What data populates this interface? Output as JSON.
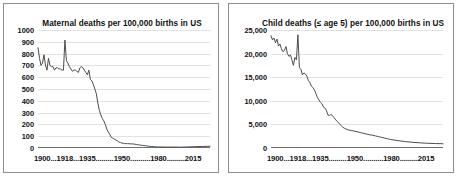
{
  "chart_data": [
    {
      "type": "line",
      "title": "Maternal deaths per 100,000 births in US",
      "xlabel": "",
      "ylabel": "",
      "xlim": [
        1900,
        2015
      ],
      "ylim": [
        0,
        1000
      ],
      "grid": true,
      "legend": "none",
      "yticks": [
        0,
        100,
        200,
        300,
        400,
        500,
        600,
        700,
        800,
        900,
        1000
      ],
      "ytick_labels": [
        "0",
        "100",
        "200",
        "300",
        "400",
        "500",
        "600",
        "700",
        "800",
        "900",
        "1000"
      ],
      "xtick_labels": [
        "1900",
        "1918",
        "1935",
        "1950",
        "1980",
        "2015"
      ],
      "xaxis_text": "1900...1918...1935.........1950..........1980.........2015",
      "line_color": "#4d4d4d",
      "x": [
        1900,
        1901,
        1902,
        1903,
        1904,
        1905,
        1906,
        1907,
        1908,
        1909,
        1910,
        1911,
        1912,
        1913,
        1914,
        1915,
        1916,
        1917,
        1918,
        1919,
        1920,
        1921,
        1922,
        1923,
        1924,
        1925,
        1926,
        1927,
        1928,
        1929,
        1930,
        1931,
        1932,
        1933,
        1934,
        1935,
        1936,
        1937,
        1938,
        1939,
        1940,
        1941,
        1942,
        1943,
        1944,
        1945,
        1946,
        1947,
        1948,
        1949,
        1950,
        1951,
        1952,
        1953,
        1954,
        1955,
        1956,
        1957,
        1958,
        1959,
        1960,
        1962,
        1964,
        1966,
        1968,
        1970,
        1972,
        1974,
        1976,
        1978,
        1980,
        1985,
        1990,
        1995,
        2000,
        2005,
        2010,
        2015
      ],
      "y": [
        850,
        760,
        700,
        720,
        790,
        700,
        660,
        760,
        700,
        690,
        690,
        660,
        680,
        680,
        670,
        670,
        660,
        660,
        915,
        740,
        720,
        690,
        670,
        650,
        660,
        660,
        650,
        640,
        680,
        690,
        680,
        660,
        640,
        620,
        660,
        580,
        570,
        540,
        500,
        460,
        380,
        320,
        280,
        250,
        230,
        200,
        160,
        135,
        115,
        90,
        83,
        75,
        68,
        61,
        52,
        47,
        41,
        41,
        37,
        37,
        37,
        35,
        34,
        29,
        25,
        22,
        19,
        15,
        13,
        10,
        9,
        8,
        8,
        7,
        9,
        11,
        13,
        15
      ],
      "notes": "Sharp spike at 1918 (Spanish flu) reaching ~915 per 100,000; steep decline from mid-1930s through 1950; near-flat low values after 1960."
    },
    {
      "type": "line",
      "title": "Child deaths (≤ age 5) per 100,000 births in US",
      "xlabel": "",
      "ylabel": "",
      "xlim": [
        1900,
        2015
      ],
      "ylim": [
        0,
        25000
      ],
      "grid": true,
      "legend": "none",
      "yticks": [
        0,
        5000,
        10000,
        15000,
        20000,
        25000
      ],
      "ytick_labels": [
        "0",
        "5,000",
        "10,000",
        "15,000",
        "20,000",
        "25,000"
      ],
      "xtick_labels": [
        "1900",
        "1918",
        "1935",
        "1950",
        "1980",
        "2015"
      ],
      "xaxis_text": "1900...1918...1935.........1950..........1980.........2015",
      "line_color": "#4d4d4d",
      "x": [
        1900,
        1901,
        1902,
        1903,
        1904,
        1905,
        1906,
        1907,
        1908,
        1909,
        1910,
        1911,
        1912,
        1913,
        1914,
        1915,
        1916,
        1917,
        1918,
        1919,
        1920,
        1921,
        1922,
        1923,
        1924,
        1925,
        1926,
        1927,
        1928,
        1929,
        1930,
        1931,
        1932,
        1933,
        1934,
        1935,
        1936,
        1937,
        1938,
        1939,
        1940,
        1941,
        1942,
        1943,
        1944,
        1945,
        1946,
        1947,
        1948,
        1949,
        1950,
        1952,
        1954,
        1956,
        1958,
        1960,
        1962,
        1964,
        1966,
        1968,
        1970,
        1972,
        1974,
        1976,
        1978,
        1980,
        1985,
        1990,
        1995,
        2000,
        2005,
        2010,
        2015
      ],
      "y": [
        23800,
        22900,
        23300,
        22300,
        23100,
        21600,
        22000,
        21000,
        20400,
        20700,
        21500,
        20000,
        19400,
        19700,
        18700,
        17500,
        19200,
        18700,
        24000,
        17000,
        16700,
        15500,
        15900,
        15700,
        15200,
        14300,
        13900,
        13100,
        12800,
        12300,
        11600,
        10700,
        10200,
        9700,
        9400,
        8700,
        8500,
        8000,
        7000,
        6900,
        7100,
        6900,
        6500,
        6100,
        5700,
        5400,
        5000,
        4700,
        4400,
        4200,
        4050,
        3800,
        3700,
        3550,
        3400,
        3250,
        3100,
        2950,
        2800,
        2700,
        2550,
        2400,
        2250,
        2100,
        1950,
        1800,
        1550,
        1350,
        1200,
        1080,
        1000,
        940,
        900
      ],
      "notes": "Starts near 24,000 per 100,000 in 1900 with a sharp 1918 spike; monotonic decline to under 1,000 by 2015."
    }
  ]
}
